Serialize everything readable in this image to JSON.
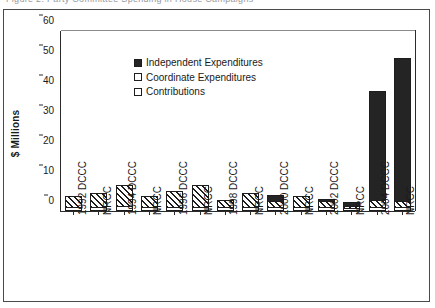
{
  "clipped_title": "Figure 2.  Party Committee Spending in House Campaigns",
  "chart_data": {
    "type": "bar",
    "title": "",
    "subtitle": "",
    "xlabel": "",
    "ylabel": "$ Millions",
    "ylim": [
      0,
      60
    ],
    "yticks": [
      0,
      10,
      20,
      30,
      40,
      50,
      60
    ],
    "grid": false,
    "stacked": true,
    "legend_position": "top-left",
    "legend": [
      "Independent Expenditures",
      "Coordinate Expenditures",
      "Contributions"
    ],
    "categories": [
      "1992 DCCC",
      "NRCC",
      "1994 DCCC",
      "NRCC",
      "1996 DCCC",
      "NRCC",
      "1998 DCCC",
      "NRCC",
      "2000 DCCC",
      "NRCC",
      "2002 DCCC",
      "NRCC",
      "2004 DCCC",
      "NRCC"
    ],
    "category_years": [
      "1992",
      "",
      "1994",
      "",
      "1996",
      "",
      "1998",
      "",
      "2000",
      "",
      "2002",
      "",
      "2004",
      ""
    ],
    "category_committees": [
      "DCCC",
      "NRCC",
      "DCCC",
      "NRCC",
      "DCCC",
      "NRCC",
      "DCCC",
      "NRCC",
      "DCCC",
      "NRCC",
      "DCCC",
      "NRCC",
      "DCCC",
      "NRCC"
    ],
    "series": [
      {
        "name": "Contributions",
        "fill": "open",
        "values": [
          0.9,
          0.9,
          1.0,
          0.8,
          0.9,
          0.9,
          0.7,
          0.8,
          0.8,
          0.8,
          0.7,
          0.6,
          0.8,
          0.7
        ]
      },
      {
        "name": "Coordinate Expenditures",
        "fill": "hatched",
        "values": [
          4.1,
          5.1,
          7.7,
          4.2,
          5.9,
          7.8,
          3.0,
          5.2,
          2.3,
          4.2,
          2.5,
          0.5,
          2.4,
          2.1
        ]
      },
      {
        "name": "Independent Expenditures",
        "fill": "solid",
        "values": [
          0.0,
          0.0,
          0.0,
          0.0,
          0.0,
          0.0,
          0.0,
          0.0,
          2.2,
          0.0,
          0.8,
          1.8,
          36.8,
          48.2
        ]
      }
    ],
    "totals": [
      5.0,
      6.0,
      8.7,
      5.0,
      6.8,
      8.7,
      3.7,
      6.0,
      5.3,
      5.0,
      4.0,
      2.9,
      40.0,
      51.0
    ]
  }
}
